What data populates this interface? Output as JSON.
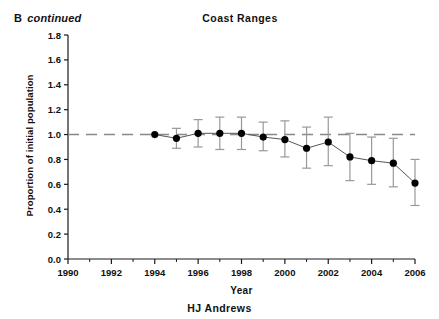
{
  "figure": {
    "panel_letter": "B",
    "panel_note": "continued",
    "footer": "HJ Andrews"
  },
  "chart_data": {
    "type": "line",
    "title": "Coast Ranges",
    "xlabel": "Year",
    "ylabel": "Proportion of initial population",
    "xlim": [
      1990,
      2006
    ],
    "ylim": [
      0.0,
      1.8
    ],
    "xticks": [
      1990,
      1992,
      1994,
      1996,
      1998,
      2000,
      2002,
      2004,
      2006
    ],
    "xtick_labels": [
      "1990",
      "1992",
      "1994",
      "1996",
      "1998",
      "2000",
      "2002",
      "2004",
      "2006"
    ],
    "yticks": [
      0.0,
      0.2,
      0.4,
      0.6,
      0.8,
      1.0,
      1.2,
      1.4,
      1.6,
      1.8
    ],
    "ytick_labels": [
      "0.0",
      "0.2",
      "0.4",
      "0.6",
      "0.8",
      "1.0",
      "1.2",
      "1.4",
      "1.6",
      "1.8"
    ],
    "minor_xticks": [
      1991,
      1993,
      1995,
      1997,
      1999,
      2001,
      2003,
      2005
    ],
    "grid": false,
    "legend": null,
    "reference_line": {
      "y": 1.0,
      "style": "dashed",
      "color": "#888888",
      "label": "1.0 initial population"
    },
    "marker": {
      "shape": "circle",
      "color": "#000000",
      "size": 6
    },
    "line": {
      "color": "#555555",
      "width": 1
    },
    "errorbar": {
      "color": "#999999",
      "cap_width": 9
    },
    "x": [
      1994,
      1995,
      1996,
      1997,
      1998,
      1999,
      2000,
      2001,
      2002,
      2003,
      2004,
      2005,
      2006
    ],
    "values": [
      1.0,
      0.97,
      1.01,
      1.01,
      1.01,
      0.98,
      0.96,
      0.89,
      0.94,
      0.82,
      0.79,
      0.77,
      0.61
    ],
    "err_low": [
      1.0,
      0.89,
      0.9,
      0.88,
      0.88,
      0.87,
      0.82,
      0.73,
      0.75,
      0.63,
      0.6,
      0.58,
      0.43
    ],
    "err_high": [
      1.0,
      1.05,
      1.12,
      1.14,
      1.14,
      1.1,
      1.11,
      1.06,
      1.14,
      1.01,
      0.98,
      0.97,
      0.8
    ]
  }
}
